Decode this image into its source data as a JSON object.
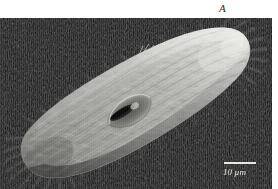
{
  "figure": {
    "panel_letter": "A",
    "caption_visible": false
  },
  "micrograph": {
    "modality": "scanning-electron-micrograph",
    "subject": "ciliate protozoan",
    "background_color": "#151515",
    "body_highlight_color": "#d8d8d4",
    "body_midtone_color": "#9a9a96",
    "body_shadow_color": "#4a4a48",
    "orientation": "posterior lower-left to anterior upper-right"
  },
  "scalebar": {
    "label": "10 µm",
    "bar_color": "#e8e8e4",
    "text_color": "#e6e6e2"
  }
}
